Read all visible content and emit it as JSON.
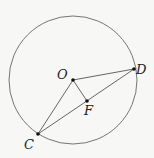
{
  "diagram": {
    "type": "geometry",
    "background": "#f7f7f5",
    "stroke_color": "#555555",
    "circle": {
      "cx": 73,
      "cy": 80,
      "r": 64
    },
    "points": [
      {
        "id": "O",
        "label": "O",
        "x": 73,
        "y": 80,
        "label_x": 57,
        "label_y": 79
      },
      {
        "id": "D",
        "label": "D",
        "x": 134,
        "y": 69,
        "label_x": 136,
        "label_y": 74
      },
      {
        "id": "F",
        "label": "F",
        "x": 87,
        "y": 101,
        "label_x": 85,
        "label_y": 115
      },
      {
        "id": "C",
        "label": "C",
        "x": 38,
        "y": 134,
        "label_x": 24,
        "label_y": 149
      }
    ],
    "segments": [
      {
        "from": "O",
        "to": "D"
      },
      {
        "from": "O",
        "to": "F"
      },
      {
        "from": "O",
        "to": "C"
      },
      {
        "from": "C",
        "to": "D"
      }
    ]
  }
}
